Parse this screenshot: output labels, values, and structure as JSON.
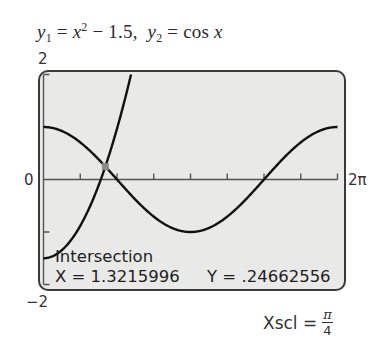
{
  "title": {
    "y1_lhs": "y",
    "y1_sub": "1",
    "y1_eq": " = ",
    "y1_x": "x",
    "y1_sup": "2",
    "y1_rest": " − 1.5,",
    "y2_lhs": "y",
    "y2_sub": "2",
    "y2_eq": " = cos ",
    "y2_x": "x"
  },
  "axis_labels": {
    "ymax": "2",
    "ymin": "−2",
    "xmin": "0",
    "xmax": "2π"
  },
  "readout": {
    "heading": "Intersection",
    "x_text": "X = 1.3215996",
    "y_text": "Y = .24662556"
  },
  "xscl": {
    "label": "Xscl =",
    "numerator": "π",
    "denominator": "4"
  },
  "colors": {
    "screen_bg": "#e9e9e8",
    "frame": "#3a3a3a",
    "curve": "#111111",
    "axis": "#555555",
    "marker": "#8a8a8a"
  },
  "chart_data": {
    "type": "line",
    "xlabel": "",
    "ylabel": "",
    "xlim": [
      0,
      6.2832
    ],
    "ylim": [
      -2,
      2
    ],
    "xscl": 0.7854,
    "yscl": 1,
    "x_tick_labels": [
      "0",
      "2π"
    ],
    "y_tick_labels": [
      "-2",
      "2"
    ],
    "grid": false,
    "legend": null,
    "series": [
      {
        "name": "y1 = x^2 - 1.5",
        "x": [
          0,
          0.25,
          0.5,
          0.75,
          1.0,
          1.25,
          1.3216,
          1.5,
          1.75,
          1.8708
        ],
        "y": [
          -1.5,
          -1.4375,
          -1.25,
          -0.9375,
          -0.5,
          0.0625,
          0.2466,
          0.75,
          1.5625,
          2.0
        ]
      },
      {
        "name": "y2 = cos x",
        "x": [
          0,
          0.7854,
          1.3216,
          1.5708,
          2.3562,
          3.1416,
          3.927,
          4.7124,
          5.4978,
          6.2832
        ],
        "y": [
          1.0,
          0.7071,
          0.2466,
          0.0,
          -0.7071,
          -1.0,
          -0.7071,
          0.0,
          0.7071,
          1.0
        ]
      }
    ],
    "annotations": [
      {
        "type": "point",
        "label": "Intersection",
        "x": 1.3215996,
        "y": 0.24662556
      }
    ]
  }
}
